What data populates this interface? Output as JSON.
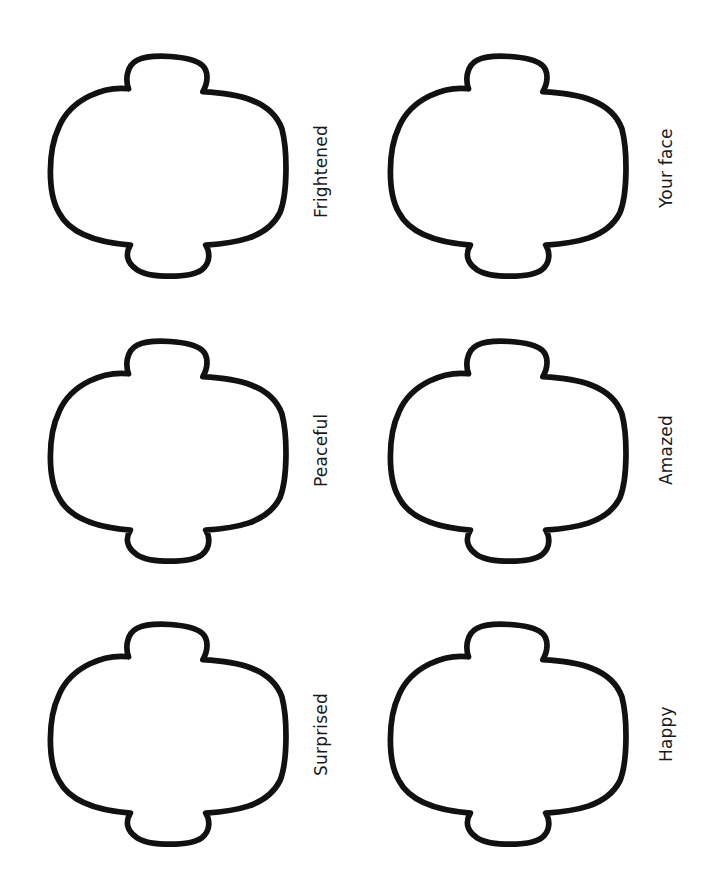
{
  "worksheet": {
    "stroke_color": "#111111",
    "background_color": "#ffffff",
    "faces": [
      {
        "label": "Frightened",
        "column": "left",
        "row": 0
      },
      {
        "label": "Your face",
        "column": "right",
        "row": 0
      },
      {
        "label": "Peaceful",
        "column": "left",
        "row": 1
      },
      {
        "label": "Amazed",
        "column": "right",
        "row": 1
      },
      {
        "label": "Surprised",
        "column": "left",
        "row": 2
      },
      {
        "label": "Happy",
        "column": "right",
        "row": 2
      }
    ]
  }
}
